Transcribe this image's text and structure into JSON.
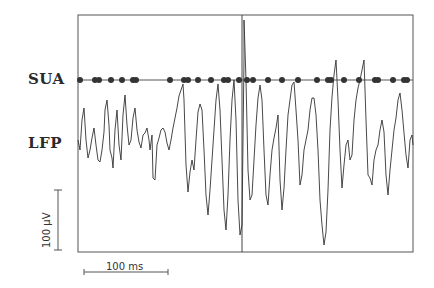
{
  "labels": {
    "sua": "SUA",
    "lfp": "LFP",
    "voltage_scale": "100 µV",
    "time_scale": "100 ms"
  },
  "colors": {
    "trace": "#333333",
    "frame": "#555555",
    "spike_dot": "#333333"
  },
  "chart_data": {
    "type": "line",
    "title": "",
    "xlabel": "",
    "ylabel": "",
    "series": [
      {
        "name": "SUA spike times (px x-position)",
        "values": [
          80,
          95,
          99,
          111,
          122,
          133,
          136,
          170,
          184,
          188,
          198,
          211,
          224,
          228,
          239,
          247,
          253,
          268,
          282,
          298,
          317,
          328,
          331,
          344,
          359,
          375,
          378,
          393,
          404,
          407
        ]
      }
    ],
    "scale_bars": {
      "voltage": "100 µV",
      "time": "100 ms"
    },
    "grid": false
  }
}
